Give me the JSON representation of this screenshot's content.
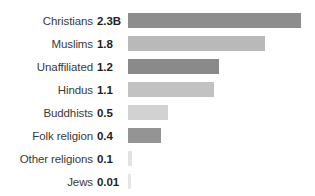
{
  "chart_data": {
    "type": "bar",
    "title": "",
    "subtitle": "",
    "xlabel": "",
    "ylabel": "",
    "orientation": "horizontal",
    "grid": false,
    "legend": false,
    "axis_visible": false,
    "units": "billions of adherents",
    "xlim": [
      0,
      2.3
    ],
    "categories": [
      "Christians",
      "Muslims",
      "Unaffiliated",
      "Hindus",
      "Buddhists",
      "Folk religion",
      "Other religions",
      "Jews"
    ],
    "values": [
      2.3,
      1.8,
      1.2,
      1.1,
      0.5,
      0.4,
      0.1,
      0.01
    ],
    "value_labels": [
      "2.3B",
      "1.8",
      "1.2",
      "1.1",
      "0.5",
      "0.4",
      "0.1",
      "0.01"
    ],
    "bar_colors": [
      "#8d8d8d",
      "#b9b9b9",
      "#8a8a8a",
      "#c2c2c2",
      "#d2d2d2",
      "#949494",
      "#e2e2e2",
      "#e6e6e6"
    ],
    "rows": [
      {
        "label": "Christians",
        "value_label": "2.3B",
        "value": 2.3,
        "color": "#8d8d8d",
        "bar_px": 173,
        "top_px": 9
      },
      {
        "label": "Muslims",
        "value_label": "1.8",
        "value": 1.8,
        "color": "#b9b9b9",
        "bar_px": 137,
        "top_px": 32
      },
      {
        "label": "Unaffiliated",
        "value_label": "1.2",
        "value": 1.2,
        "color": "#8a8a8a",
        "bar_px": 91,
        "top_px": 55
      },
      {
        "label": "Hindus",
        "value_label": "1.1",
        "value": 1.1,
        "color": "#c2c2c2",
        "bar_px": 86,
        "top_px": 78
      },
      {
        "label": "Buddhists",
        "value_label": "0.5",
        "value": 0.5,
        "color": "#d2d2d2",
        "bar_px": 40,
        "top_px": 101
      },
      {
        "label": "Folk religion",
        "value_label": "0.4",
        "value": 0.4,
        "color": "#949494",
        "bar_px": 33,
        "top_px": 124
      },
      {
        "label": "Other religions",
        "value_label": "0.1",
        "value": 0.1,
        "color": "#e2e2e2",
        "bar_px": 4,
        "top_px": 147
      },
      {
        "label": "Jews",
        "value_label": "0.01",
        "value": 0.01,
        "color": "#e6e6e6",
        "bar_px": 3,
        "top_px": 170
      }
    ]
  }
}
